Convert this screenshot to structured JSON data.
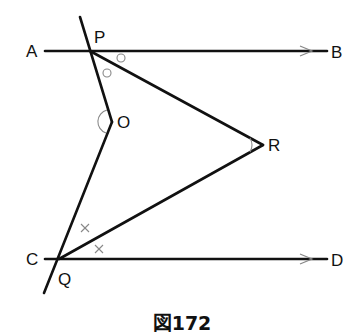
{
  "figure": {
    "caption": "図172",
    "labels": {
      "A": "A",
      "B": "B",
      "C": "C",
      "D": "D",
      "P": "P",
      "Q": "Q",
      "O": "O",
      "R": "R"
    },
    "points": {
      "P": [
        90,
        51
      ],
      "Q": [
        59,
        259
      ],
      "O": [
        112,
        122
      ],
      "R": [
        263,
        145
      ]
    },
    "lines": [
      {
        "name": "AB",
        "from": "A",
        "to": "B",
        "type": "ray-arrow",
        "note": "parallel to CD"
      },
      {
        "name": "CD",
        "from": "C",
        "to": "D",
        "type": "ray-arrow",
        "note": "parallel to AB"
      },
      {
        "name": "transversal-PO",
        "from": "P",
        "to": "O"
      },
      {
        "name": "transversal-OQ",
        "from": "O",
        "to": "Q"
      },
      {
        "name": "PR",
        "from": "P",
        "to": "R"
      },
      {
        "name": "QR",
        "from": "Q",
        "to": "R"
      }
    ],
    "angle_marks": {
      "P_equal_angles": "circle",
      "Q_equal_angles": "cross",
      "O_angle": "arc",
      "R_angle": "arc"
    },
    "colors": {
      "line": "#111111",
      "mark": "#888888"
    }
  }
}
